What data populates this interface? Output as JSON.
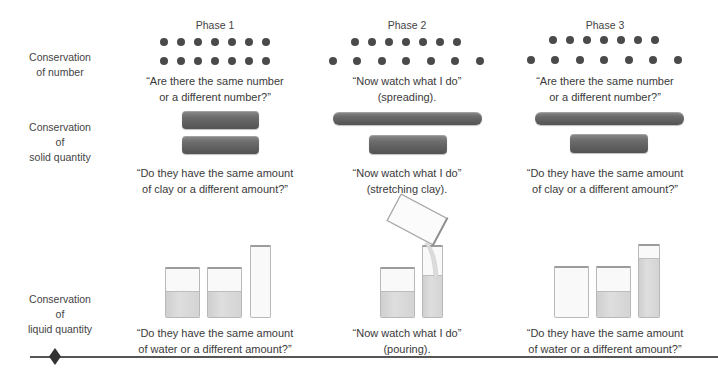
{
  "phases": [
    {
      "label": "Phase 1"
    },
    {
      "label": "Phase 2"
    },
    {
      "label": "Phase 3"
    }
  ],
  "rows": [
    {
      "label_line1": "Conservation",
      "label_line2": "of number",
      "label_line3": ""
    },
    {
      "label_line1": "Conservation",
      "label_line2": "of",
      "label_line3": "solid quantity"
    },
    {
      "label_line1": "Conservation",
      "label_line2": "of",
      "label_line3": "liquid quantity"
    }
  ],
  "captions": {
    "number": [
      {
        "line1": "“Are there the same number",
        "line2": "or a different number?”"
      },
      {
        "line1": "“Now watch what I do”",
        "line2": "(spreading)."
      },
      {
        "line1": "“Are there the same number",
        "line2": "or a different number?”"
      }
    ],
    "solid": [
      {
        "line1": "“Do they have the same amount",
        "line2": "of clay or a different amount?”"
      },
      {
        "line1": "“Now watch what I do”",
        "line2": "(stretching clay)."
      },
      {
        "line1": "“Do they have the same amount",
        "line2": "of clay or a different amount?”"
      }
    ],
    "liquid": [
      {
        "line1": "“Do they have the same amount",
        "line2": "of water or a different amount?”"
      },
      {
        "line1": "“Now watch what I do”",
        "line2": "(pouring)."
      },
      {
        "line1": "“Do they have the same amount",
        "line2": "of water or a different amount?”"
      }
    ]
  },
  "icons": {
    "counter": "dot-icon",
    "clay": "clay-roll-icon",
    "beaker": "beaker-icon",
    "tall_glass": "tall-glass-icon",
    "divider_marker": "diamond-icon"
  },
  "colors": {
    "dot": "#4a4a4a",
    "clay": "#666666",
    "water": "#d4d4d4",
    "glass_outline": "#b8b8b8",
    "rule": "#555555",
    "text": "#3a3a3a"
  }
}
